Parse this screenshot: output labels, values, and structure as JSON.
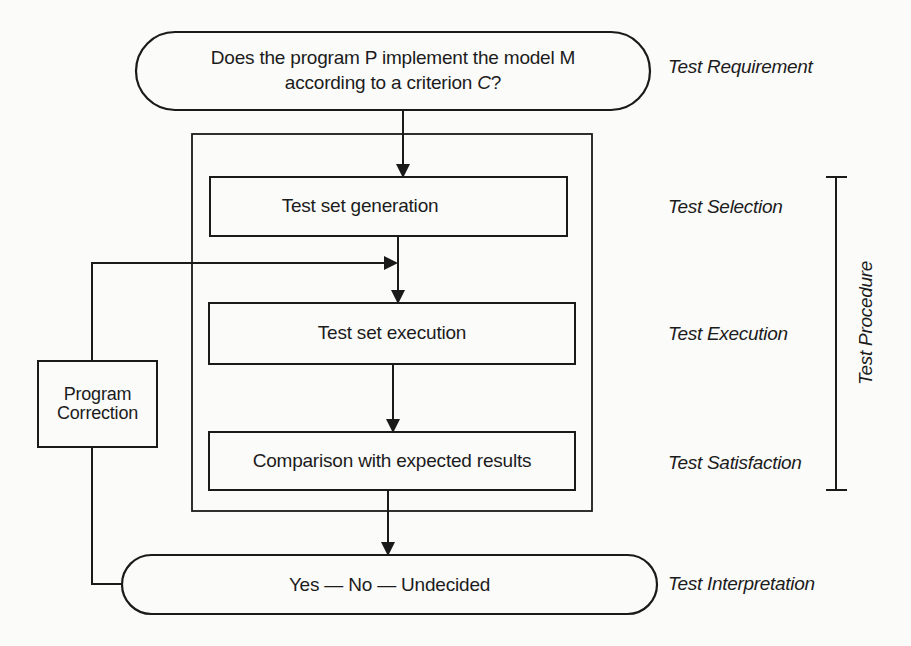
{
  "diagram": {
    "type": "flowchart",
    "title": "",
    "colors": {
      "line": "#1a1a1a",
      "text": "#1c1c1c",
      "background": "#fbfbfa"
    },
    "nodes": {
      "requirement": {
        "shape": "rounded-pill",
        "line1": "Does the program P implement the model M",
        "line2_prefix": "according to a criterion ",
        "line2_var": "C",
        "line2_suffix": "?"
      },
      "generation": {
        "shape": "rectangle",
        "label": "Test set generation"
      },
      "execution": {
        "shape": "rectangle",
        "label": "Test set execution"
      },
      "comparison": {
        "shape": "rectangle",
        "label": "Comparison with expected results"
      },
      "interpretation": {
        "shape": "rounded-pill",
        "label": "Yes — No — Undecided"
      },
      "correction": {
        "shape": "rectangle",
        "line1": "Program",
        "line2": "Correction"
      }
    },
    "stage_labels": {
      "requirement": "Test Requirement",
      "selection": "Test Selection",
      "execution": "Test Execution",
      "satisfaction": "Test Satisfaction",
      "interpretation": "Test Interpretation",
      "procedure": "Test Procedure"
    },
    "edges": [
      {
        "from": "requirement",
        "to": "generation"
      },
      {
        "from": "generation",
        "to": "execution"
      },
      {
        "from": "execution",
        "to": "comparison"
      },
      {
        "from": "comparison",
        "to": "interpretation"
      },
      {
        "from": "interpretation",
        "to": "correction"
      },
      {
        "from": "correction",
        "to": "execution"
      }
    ],
    "bracket": {
      "label": "Test Procedure",
      "spans": [
        "Test Selection",
        "Test Execution",
        "Test Satisfaction"
      ]
    }
  }
}
